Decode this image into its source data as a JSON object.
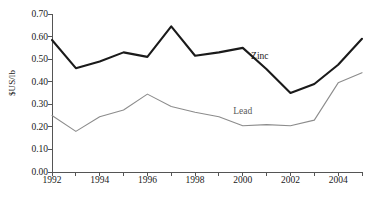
{
  "chart_data": {
    "type": "line",
    "title": "",
    "xlabel": "",
    "ylabel": "$US/lb",
    "ylim": [
      0.0,
      0.7
    ],
    "ytick_step": 0.1,
    "yticks": [
      "0.00",
      "0.10",
      "0.20",
      "0.30",
      "0.40",
      "0.50",
      "0.60",
      "0.70"
    ],
    "xlim": [
      1992,
      2005
    ],
    "x": [
      1992,
      1993,
      1994,
      1995,
      1996,
      1997,
      1998,
      1999,
      2000,
      2001,
      2002,
      2003,
      2004,
      2005
    ],
    "xtick_labels": [
      "1992",
      "1994",
      "1996",
      "1998",
      "2000",
      "2002",
      "2004"
    ],
    "xtick_label_years": [
      1992,
      1994,
      1996,
      1998,
      2000,
      2002,
      2004
    ],
    "grid": false,
    "legend_position": "inline-annotations",
    "series": [
      {
        "name": "Zinc",
        "color": "#1a1a1a",
        "width": 2.1,
        "values": [
          0.585,
          0.46,
          0.49,
          0.53,
          0.51,
          0.645,
          0.515,
          0.53,
          0.55,
          0.455,
          0.35,
          0.39,
          0.475,
          0.59
        ],
        "label_x": 2000.35,
        "label_y": 0.508
      },
      {
        "name": "Lead",
        "color": "#8c8c8c",
        "width": 1.1,
        "values": [
          0.25,
          0.18,
          0.245,
          0.275,
          0.345,
          0.29,
          0.265,
          0.245,
          0.205,
          0.21,
          0.205,
          0.23,
          0.395,
          0.44
        ],
        "label_x": 1999.6,
        "label_y": 0.268
      }
    ]
  },
  "annotations": {
    "cut_title_text": "",
    "cut_caption_text": ""
  }
}
